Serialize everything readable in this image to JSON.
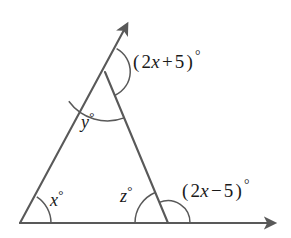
{
  "figure": {
    "type": "geometry-diagram",
    "background_color": "#ffffff",
    "stroke_color": "#595959",
    "text_color": "#1a1a1a"
  },
  "labels": {
    "exterior_top": {
      "full": "(2x + 5)°",
      "open_paren": "(",
      "coefficient": "2",
      "variable": "x",
      "operator": "+",
      "constant": "5",
      "close_paren": ")",
      "degree": "°"
    },
    "exterior_bottom": {
      "full": "(2x - 5)°",
      "open_paren": "(",
      "coefficient": "2",
      "variable": "x",
      "operator": "−",
      "constant": "5",
      "close_paren": ")",
      "degree": "°"
    },
    "interior_apex": {
      "full": "y°",
      "variable": "y",
      "degree": "°"
    },
    "interior_left": {
      "full": "x°",
      "variable": "x",
      "degree": "°"
    },
    "interior_right": {
      "full": "z°",
      "variable": "z",
      "degree": "°"
    }
  },
  "geometry": {
    "apex": {
      "x": 105,
      "y": 72
    },
    "left_vertex": {
      "x": 20,
      "y": 223
    },
    "right_vertex": {
      "x": 168,
      "y": 223
    },
    "ray_up_tip": {
      "x": 128,
      "y": 25
    },
    "ray_right_tip": {
      "x": 275,
      "y": 223
    },
    "arcs": [
      {
        "name": "exterior-top-arc",
        "vertex": "apex",
        "radius": 26
      },
      {
        "name": "interior-apex-arc",
        "vertex": "apex",
        "radius": 48
      },
      {
        "name": "interior-left-arc",
        "vertex": "left_vertex",
        "radius": 31
      },
      {
        "name": "interior-right-arc",
        "vertex": "right_vertex",
        "radius": 33
      },
      {
        "name": "exterior-bottom-arc",
        "vertex": "right_vertex",
        "radius": 22
      }
    ]
  }
}
